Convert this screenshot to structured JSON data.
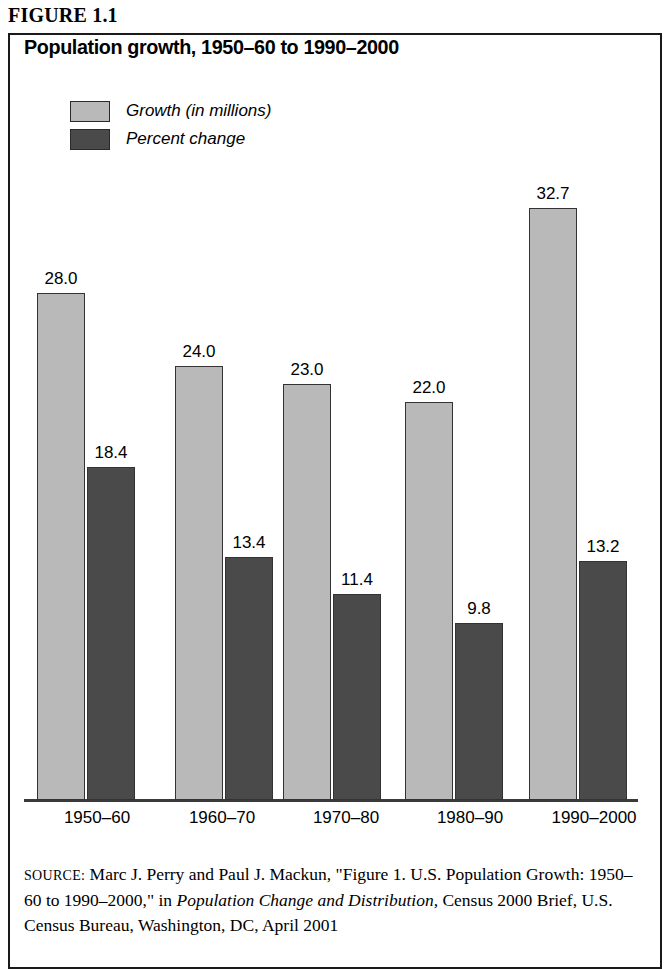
{
  "figure": {
    "label": "FIGURE 1.1",
    "title": "Population growth, 1950–60 to 1990–2000"
  },
  "legend": {
    "items": [
      {
        "label": "Growth (in millions)",
        "color": "#b9b9b9",
        "series": "growth"
      },
      {
        "label": "Percent change",
        "color": "#4a4a4a",
        "series": "percent"
      }
    ]
  },
  "source": {
    "prefix": "SOURCE:",
    "text_1": " Marc J. Perry and Paul J. Mackun, \"Figure 1. U.S. Population Growth: 1950–60 to 1990–2000,\" in ",
    "italic_1": "Population Change and Distribution,",
    "text_2": " Census 2000 Brief, U.S. Census Bureau, Washington, DC, April 2001"
  },
  "chart_data": {
    "type": "bar",
    "title": "Population growth, 1950–60 to 1990–2000",
    "xlabel": "",
    "ylabel": "",
    "ylim": [
      0,
      34
    ],
    "grid": false,
    "legend_position": "top-left",
    "categories": [
      "1950–60",
      "1960–70",
      "1970–80",
      "1980–90",
      "1990–2000"
    ],
    "series": [
      {
        "name": "Growth (in millions)",
        "color": "#b9b9b9",
        "values": [
          28.0,
          24.0,
          23.0,
          22.0,
          32.7
        ],
        "labels": [
          "28.0",
          "24.0",
          "23.0",
          "22.0",
          "32.7"
        ]
      },
      {
        "name": "Percent change",
        "color": "#4a4a4a",
        "values": [
          18.4,
          13.4,
          11.4,
          9.8,
          13.2
        ],
        "labels": [
          "18.4",
          "13.4",
          "11.4",
          "9.8",
          "13.2"
        ]
      }
    ]
  }
}
